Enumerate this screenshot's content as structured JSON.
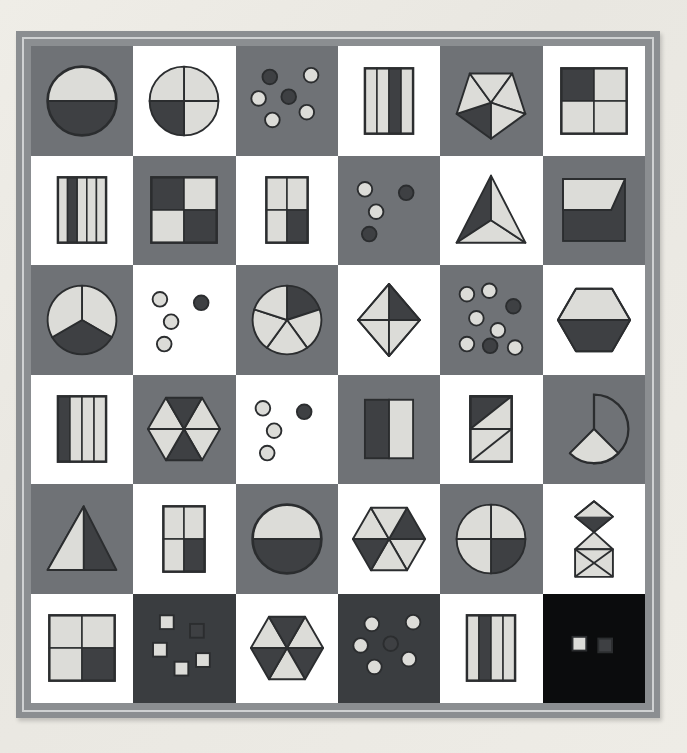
{
  "poster": {
    "title": "Fractions Shapes Grid Poster",
    "rows": 6,
    "columns": 6,
    "frame_color": "#8b8e91",
    "frame_inner_line_color": "#cfd1d2",
    "page_background": "#eceae4"
  },
  "palette": {
    "light_fill": "#dcdcd8",
    "dark_fill": "#3e4043",
    "outline": "#2b2d2f",
    "cell_white": "#ffffff",
    "cell_gray": "#6f7276",
    "cell_dark": "#3a3d40",
    "cell_black": "#0b0c0d"
  },
  "chart_data": {
    "type": "table",
    "xlabel": "column",
    "ylabel": "row",
    "columns": [
      "col 1",
      "col 2",
      "col 3",
      "col 4",
      "col 5",
      "col 6"
    ],
    "rows": [
      "row 1",
      "row 2",
      "row 3",
      "row 4",
      "row 5",
      "row 6"
    ],
    "cells": [
      {
        "r": 1,
        "c": 1,
        "bg": "gray",
        "shape": "circle",
        "parts": 2,
        "shaded": 1,
        "fraction": "1/2"
      },
      {
        "r": 1,
        "c": 2,
        "bg": "white",
        "shape": "circle",
        "parts": 4,
        "shaded": 1,
        "fraction": "1/4"
      },
      {
        "r": 1,
        "c": 3,
        "bg": "gray",
        "shape": "circle-set",
        "parts": 6,
        "shaded": 2,
        "fraction": "2/6"
      },
      {
        "r": 1,
        "c": 4,
        "bg": "white",
        "shape": "rectangle-bars",
        "parts": 4,
        "shaded": 1,
        "fraction": "1/4"
      },
      {
        "r": 1,
        "c": 5,
        "bg": "gray",
        "shape": "pentagon",
        "parts": 5,
        "shaded": 1,
        "fraction": "1/5"
      },
      {
        "r": 1,
        "c": 6,
        "bg": "white",
        "shape": "square-quads",
        "parts": 4,
        "shaded": 1,
        "fraction": "1/4"
      },
      {
        "r": 2,
        "c": 1,
        "bg": "white",
        "shape": "rectangle-bars",
        "parts": 5,
        "shaded": 1,
        "fraction": "1/5"
      },
      {
        "r": 2,
        "c": 2,
        "bg": "gray",
        "shape": "square-quads",
        "parts": 4,
        "shaded": 2,
        "fraction": "2/4"
      },
      {
        "r": 2,
        "c": 3,
        "bg": "white",
        "shape": "rectangle-quads",
        "parts": 4,
        "shaded": 1,
        "fraction": "1/4"
      },
      {
        "r": 2,
        "c": 4,
        "bg": "gray",
        "shape": "circle-set",
        "parts": 4,
        "shaded": 2,
        "fraction": "2/4"
      },
      {
        "r": 2,
        "c": 5,
        "bg": "white",
        "shape": "triangle",
        "parts": 3,
        "shaded": 1,
        "fraction": "1/3"
      },
      {
        "r": 2,
        "c": 6,
        "bg": "gray",
        "shape": "square-diagonal-split",
        "parts": 2,
        "shaded": 1,
        "fraction": "1/2"
      },
      {
        "r": 3,
        "c": 1,
        "bg": "gray",
        "shape": "circle",
        "parts": 3,
        "shaded": 1,
        "fraction": "1/3"
      },
      {
        "r": 3,
        "c": 2,
        "bg": "white",
        "shape": "circle-set",
        "parts": 4,
        "shaded": 1,
        "fraction": "1/4"
      },
      {
        "r": 3,
        "c": 3,
        "bg": "gray",
        "shape": "circle",
        "parts": 5,
        "shaded": 1,
        "fraction": "1/5"
      },
      {
        "r": 3,
        "c": 4,
        "bg": "white",
        "shape": "rhombus",
        "parts": 4,
        "shaded": 1,
        "fraction": "1/4"
      },
      {
        "r": 3,
        "c": 5,
        "bg": "gray",
        "shape": "circle-set",
        "parts": 8,
        "shaded": 2,
        "fraction": "2/8"
      },
      {
        "r": 3,
        "c": 6,
        "bg": "white",
        "shape": "hexagon-halves",
        "parts": 2,
        "shaded": 1,
        "fraction": "1/2"
      },
      {
        "r": 4,
        "c": 1,
        "bg": "white",
        "shape": "rectangle-bars",
        "parts": 4,
        "shaded": 1,
        "fraction": "1/4"
      },
      {
        "r": 4,
        "c": 2,
        "bg": "gray",
        "shape": "hexagon-sixths",
        "parts": 6,
        "shaded": 2,
        "fraction": "2/6"
      },
      {
        "r": 4,
        "c": 3,
        "bg": "white",
        "shape": "circle-set",
        "parts": 4,
        "shaded": 1,
        "fraction": "1/4"
      },
      {
        "r": 4,
        "c": 4,
        "bg": "gray",
        "shape": "rectangle-halves",
        "parts": 2,
        "shaded": 1,
        "fraction": "1/2"
      },
      {
        "r": 4,
        "c": 5,
        "bg": "white",
        "shape": "rectangle-diagonals",
        "parts": 4,
        "shaded": 1,
        "fraction": "1/4"
      },
      {
        "r": 4,
        "c": 6,
        "bg": "gray",
        "shape": "circle-sector",
        "parts": 4,
        "shaded": 1,
        "fraction": "1/4"
      },
      {
        "r": 5,
        "c": 1,
        "bg": "gray",
        "shape": "triangle-half",
        "parts": 2,
        "shaded": 1,
        "fraction": "1/2"
      },
      {
        "r": 5,
        "c": 2,
        "bg": "white",
        "shape": "rectangle-quads",
        "parts": 4,
        "shaded": 1,
        "fraction": "1/4"
      },
      {
        "r": 5,
        "c": 3,
        "bg": "gray",
        "shape": "circle",
        "parts": 2,
        "shaded": 1,
        "fraction": "1/2"
      },
      {
        "r": 5,
        "c": 4,
        "bg": "white",
        "shape": "hexagon-sixths",
        "parts": 6,
        "shaded": 2,
        "fraction": "2/6"
      },
      {
        "r": 5,
        "c": 5,
        "bg": "gray",
        "shape": "circle",
        "parts": 4,
        "shaded": 1,
        "fraction": "1/4"
      },
      {
        "r": 5,
        "c": 6,
        "bg": "white",
        "shape": "diamond-stack",
        "parts": 4,
        "shaded": 1,
        "fraction": "1/4"
      },
      {
        "r": 6,
        "c": 1,
        "bg": "white",
        "shape": "square-quads",
        "parts": 4,
        "shaded": 1,
        "fraction": "1/4"
      },
      {
        "r": 6,
        "c": 2,
        "bg": "dark",
        "shape": "square-set",
        "parts": 5,
        "shaded": 1,
        "fraction": "1/5"
      },
      {
        "r": 6,
        "c": 3,
        "bg": "white",
        "shape": "hexagon-sixths",
        "parts": 6,
        "shaded": 3,
        "fraction": "3/6"
      },
      {
        "r": 6,
        "c": 4,
        "bg": "dark",
        "shape": "circle-set",
        "parts": 6,
        "shaded": 1,
        "fraction": "1/6"
      },
      {
        "r": 6,
        "c": 5,
        "bg": "white",
        "shape": "rectangle-bars",
        "parts": 4,
        "shaded": 1,
        "fraction": "1/4"
      },
      {
        "r": 6,
        "c": 6,
        "bg": "black",
        "shape": "square-set",
        "parts": 2,
        "shaded": 1,
        "fraction": "1/2"
      }
    ]
  }
}
